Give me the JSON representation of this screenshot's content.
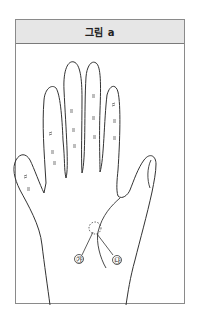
{
  "figure": {
    "title": "그림 a",
    "markers": [
      {
        "id": "ga",
        "label": "㉮"
      },
      {
        "id": "na",
        "label": "㉯"
      }
    ],
    "colors": {
      "header_bg": "#e6e6e6",
      "border": "#8a8a8a",
      "line": "#333333"
    }
  }
}
